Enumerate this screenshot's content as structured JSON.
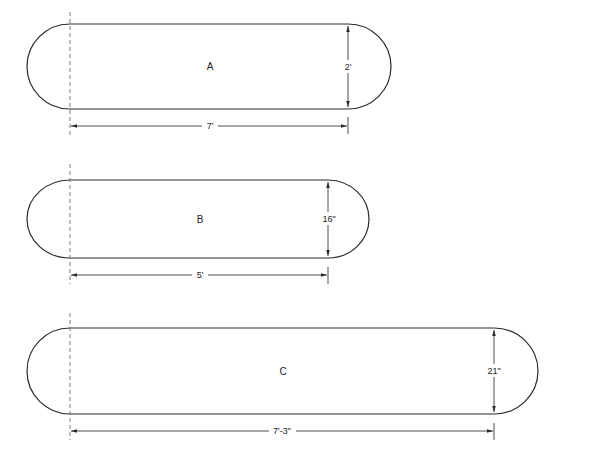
{
  "diagram": {
    "type": "table-top plan shapes (racetrack / oval ends)",
    "shapes": [
      {
        "id": "A",
        "label": "A",
        "length_label": "7'",
        "width_label": "2'"
      },
      {
        "id": "B",
        "label": "B",
        "length_label": "5'",
        "width_label": "16\""
      },
      {
        "id": "C",
        "label": "C",
        "length_label": "7'-3\"",
        "width_label": "21\""
      }
    ]
  },
  "colors": {
    "outline": "#2a2a2a",
    "centerline": "#7a7a7a",
    "background": "#ffffff"
  }
}
